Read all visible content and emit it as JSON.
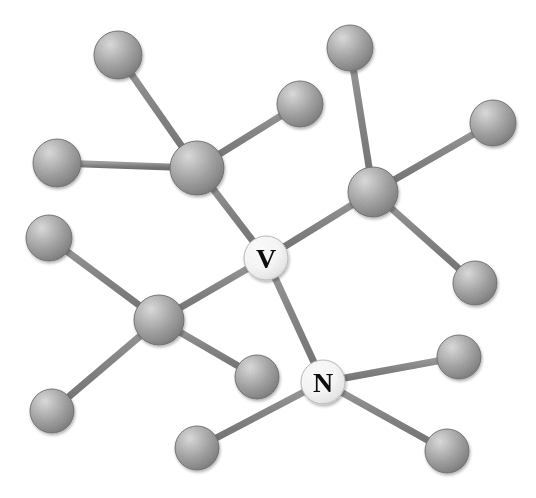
{
  "figure": {
    "type": "ball-and-stick-molecular-diagram",
    "width": 536,
    "height": 498,
    "background_color": "#ffffff"
  },
  "style": {
    "bond_color": "#808080",
    "bond_highlight_color": "#9a9a9a",
    "bond_width": 7,
    "sphere_base_color": "#9d9d9d",
    "sphere_light_color": "#d2d2d2",
    "sphere_dark_color": "#7a7a7a",
    "sphere_edge_color": "#6e6e6e",
    "label_sphere_color": "#f6f6f6",
    "label_sphere_light_color": "#ffffff",
    "label_sphere_dark_color": "#d8d8d8",
    "label_text_color": "#0d0d0d"
  },
  "atoms": [
    {
      "id": "V",
      "label": "V",
      "labeled": true,
      "x": 266,
      "y": 258,
      "r": 22,
      "name": "atom-v-center"
    },
    {
      "id": "N",
      "label": "N",
      "labeled": true,
      "x": 323,
      "y": 382,
      "r": 22,
      "name": "atom-n-center"
    },
    {
      "id": "HUB_TL",
      "label": "",
      "labeled": false,
      "x": 197,
      "y": 168,
      "r": 27,
      "name": "atom-hub-top-left"
    },
    {
      "id": "HUB_TR",
      "label": "",
      "labeled": false,
      "x": 373,
      "y": 192,
      "r": 25,
      "name": "atom-hub-top-right"
    },
    {
      "id": "HUB_BL",
      "label": "",
      "labeled": false,
      "x": 159,
      "y": 320,
      "r": 25,
      "name": "atom-hub-bottom-left"
    },
    {
      "id": "TL1",
      "label": "",
      "labeled": false,
      "x": 118,
      "y": 55,
      "r": 24,
      "name": "atom-top-left-terminal"
    },
    {
      "id": "TL2",
      "label": "",
      "labeled": false,
      "x": 57,
      "y": 163,
      "r": 24,
      "name": "atom-left-upper-terminal"
    },
    {
      "id": "TC1",
      "label": "",
      "labeled": false,
      "x": 300,
      "y": 104,
      "r": 23,
      "name": "atom-top-center-terminal"
    },
    {
      "id": "TR1",
      "label": "",
      "labeled": false,
      "x": 350,
      "y": 48,
      "r": 23,
      "name": "atom-top-right-terminal"
    },
    {
      "id": "TR2",
      "label": "",
      "labeled": false,
      "x": 493,
      "y": 123,
      "r": 23,
      "name": "atom-right-upper-terminal"
    },
    {
      "id": "MR1",
      "label": "",
      "labeled": false,
      "x": 475,
      "y": 283,
      "r": 22,
      "name": "atom-right-middle-terminal"
    },
    {
      "id": "ML1",
      "label": "",
      "labeled": false,
      "x": 49,
      "y": 238,
      "r": 23,
      "name": "atom-left-middle-terminal"
    },
    {
      "id": "BL1",
      "label": "",
      "labeled": false,
      "x": 52,
      "y": 411,
      "r": 22,
      "name": "atom-bottom-left-terminal"
    },
    {
      "id": "BC1",
      "label": "",
      "labeled": false,
      "x": 257,
      "y": 377,
      "r": 22,
      "name": "atom-bottom-center-inner-terminal"
    },
    {
      "id": "BC2",
      "label": "",
      "labeled": false,
      "x": 197,
      "y": 448,
      "r": 22,
      "name": "atom-bottom-center-terminal"
    },
    {
      "id": "BR1",
      "label": "",
      "labeled": false,
      "x": 459,
      "y": 357,
      "r": 22,
      "name": "atom-bottom-right-upper-terminal"
    },
    {
      "id": "BR2",
      "label": "",
      "labeled": false,
      "x": 447,
      "y": 451,
      "r": 22,
      "name": "atom-bottom-right-terminal"
    }
  ],
  "bonds": [
    {
      "from": "HUB_TL",
      "to": "TL1",
      "name": "bond-hubtl-tl1"
    },
    {
      "from": "HUB_TL",
      "to": "TL2",
      "name": "bond-hubtl-tl2"
    },
    {
      "from": "HUB_TL",
      "to": "TC1",
      "name": "bond-hubtl-tc1"
    },
    {
      "from": "HUB_TL",
      "to": "V",
      "name": "bond-hubtl-v"
    },
    {
      "from": "HUB_TR",
      "to": "TR1",
      "name": "bond-hubtr-tr1"
    },
    {
      "from": "HUB_TR",
      "to": "TR2",
      "name": "bond-hubtr-tr2"
    },
    {
      "from": "HUB_TR",
      "to": "MR1",
      "name": "bond-hubtr-mr1"
    },
    {
      "from": "HUB_TR",
      "to": "V",
      "name": "bond-hubtr-v"
    },
    {
      "from": "HUB_BL",
      "to": "ML1",
      "name": "bond-hubbl-ml1"
    },
    {
      "from": "HUB_BL",
      "to": "BL1",
      "name": "bond-hubbl-bl1"
    },
    {
      "from": "HUB_BL",
      "to": "BC1",
      "name": "bond-hubbl-bc1"
    },
    {
      "from": "HUB_BL",
      "to": "V",
      "name": "bond-hubbl-v"
    },
    {
      "from": "V",
      "to": "N",
      "name": "bond-v-n"
    },
    {
      "from": "N",
      "to": "BR1",
      "name": "bond-n-br1"
    },
    {
      "from": "N",
      "to": "BR2",
      "name": "bond-n-br2"
    },
    {
      "from": "N",
      "to": "BC2",
      "name": "bond-n-bc2"
    }
  ]
}
